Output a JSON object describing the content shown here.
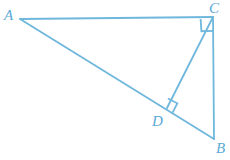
{
  "figure": {
    "canvas": {
      "width": 230,
      "height": 160
    },
    "stroke_color": "#6fb7dc",
    "label_color": "#5aa9d6",
    "stroke_width": 1.8,
    "background": "#ffffff"
  },
  "points": {
    "A": {
      "label": "A",
      "x": 20,
      "y": 19,
      "label_x": 4,
      "label_y": 8
    },
    "B": {
      "label": "B",
      "x": 214,
      "y": 139,
      "label_x": 216,
      "label_y": 141
    },
    "C": {
      "label": "C",
      "x": 213,
      "y": 17,
      "label_x": 209,
      "label_y": 1
    },
    "D": {
      "label": "D",
      "x": 167,
      "y": 108,
      "label_x": 152,
      "label_y": 114
    }
  },
  "segments": [
    {
      "name": "segment-AC",
      "from": "A",
      "to": "C",
      "x1": 20,
      "y1": 19,
      "x2": 213,
      "y2": 17
    },
    {
      "name": "segment-AB",
      "from": "A",
      "to": "B",
      "x1": 20,
      "y1": 19,
      "x2": 214,
      "y2": 139
    },
    {
      "name": "segment-CB",
      "from": "C",
      "to": "B",
      "x1": 213,
      "y1": 17,
      "x2": 214,
      "y2": 139
    },
    {
      "name": "segment-CD",
      "from": "C",
      "to": "D",
      "x1": 213,
      "y1": 17,
      "x2": 167,
      "y2": 108
    }
  ],
  "right_angles": [
    {
      "name": "right-angle-at-C",
      "at": "C",
      "marker_path": "M 200.6 19.0 L 201.4 31.2 L 213.5 30.8",
      "description": "right angle between CA and CB"
    },
    {
      "name": "right-angle-at-D",
      "at": "D",
      "marker_path": "M 167.9 98.5 L 177.3 103.3 L 172.6 112.6",
      "description": "right angle between DC and DB"
    }
  ],
  "labels": {
    "A": "A",
    "B": "B",
    "C": "C",
    "D": "D"
  }
}
